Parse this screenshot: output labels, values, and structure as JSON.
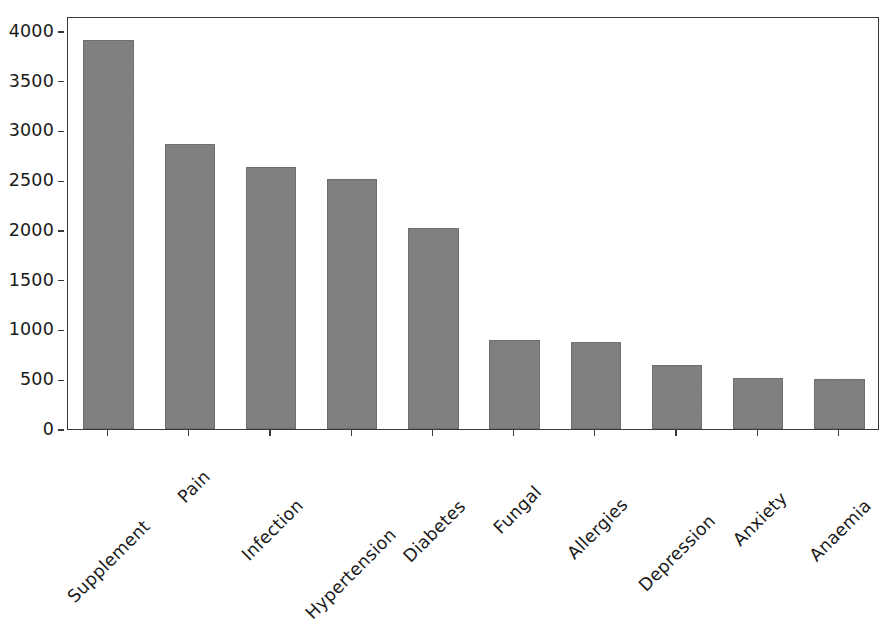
{
  "chart_data": {
    "type": "bar",
    "title": "",
    "subtitle": "",
    "xlabel": "",
    "ylabel": "",
    "categories": [
      "Supplement",
      "Pain",
      "Infection",
      "Hypertension",
      "Diabetes",
      "Fungal",
      "Allergies",
      "Depression",
      "Anxiety",
      "Anaemia"
    ],
    "values": [
      3910,
      2860,
      2630,
      2510,
      2020,
      890,
      875,
      640,
      515,
      505
    ],
    "series": [
      {
        "name": "count",
        "values": [
          3910,
          2860,
          2630,
          2510,
          2020,
          890,
          875,
          640,
          515,
          505
        ]
      }
    ],
    "ylim": [
      0,
      4150
    ],
    "yticks": [
      0,
      500,
      1000,
      1500,
      2000,
      2500,
      3000,
      3500,
      4000
    ],
    "ytick_labels": [
      "0",
      "500",
      "1000",
      "1500",
      "2000",
      "2500",
      "3000",
      "3500",
      "4000"
    ],
    "xtick_labels": [
      "Supplement",
      "Pain",
      "Infection",
      "Hypertension",
      "Diabetes",
      "Fungal",
      "Allergies",
      "Depression",
      "Anxiety",
      "Anaemia"
    ],
    "xtick_rotation": -45,
    "grid": false,
    "legend": null,
    "legend_position": "none",
    "annotations": [],
    "bar_color": "#808080",
    "bar_edge_color": "#6f6f6f",
    "axis_color": "#3a3a3a",
    "background_color": "#ffffff"
  },
  "axes": {
    "y": {
      "ticks": [
        {
          "label": "4000",
          "value": 4000
        },
        {
          "label": "3500",
          "value": 3500
        },
        {
          "label": "3000",
          "value": 3000
        },
        {
          "label": "2500",
          "value": 2500
        },
        {
          "label": "2000",
          "value": 2000
        },
        {
          "label": "1500",
          "value": 1500
        },
        {
          "label": "1000",
          "value": 1000
        },
        {
          "label": "500",
          "value": 500
        },
        {
          "label": "0",
          "value": 0
        }
      ]
    },
    "x": {
      "ticks": [
        {
          "label": "Supplement"
        },
        {
          "label": "Pain"
        },
        {
          "label": "Infection"
        },
        {
          "label": "Hypertension"
        },
        {
          "label": "Diabetes"
        },
        {
          "label": "Fungal"
        },
        {
          "label": "Allergies"
        },
        {
          "label": "Depression"
        },
        {
          "label": "Anxiety"
        },
        {
          "label": "Anaemia"
        }
      ]
    }
  }
}
